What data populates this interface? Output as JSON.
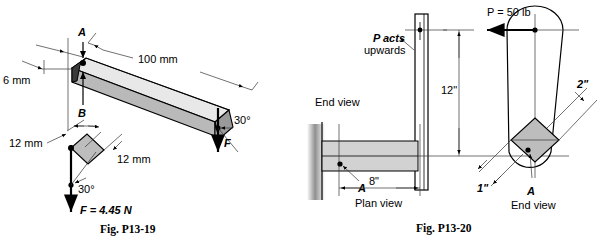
{
  "figures": [
    {
      "id": "fig-p13-19",
      "caption": "Fig. P13-19",
      "labels": {
        "point_a": "A",
        "point_b": "B",
        "length": "100 mm",
        "thickness": "6 mm",
        "angle_main": "30°",
        "force_main": "F",
        "inset_width": "12 mm",
        "inset_depth": "12 mm",
        "inset_angle": "30°",
        "inset_force": "F = 4.45 N"
      }
    },
    {
      "id": "fig-p13-20",
      "caption": "Fig. P13-20",
      "labels": {
        "note_line1": "P acts",
        "note_line2": "upwards",
        "end_view_left": "End view",
        "plan_view": "Plan view",
        "end_view_right": "End view",
        "height": "12\"",
        "length": "8\"",
        "load": "P = 50 lb",
        "dim_small": "1\"",
        "dim_large": "2\"",
        "point_a_plan": "A",
        "point_a_end": "A"
      }
    }
  ],
  "colors": {
    "stroke": "#000000",
    "face_top": "#e8e8e8",
    "face_side": "#b9b9b9",
    "face_end": "#9a9a9a",
    "bar_fill": "#d2d2d2",
    "diamond_fill": "#bdbdbd",
    "background": "#ffffff"
  }
}
